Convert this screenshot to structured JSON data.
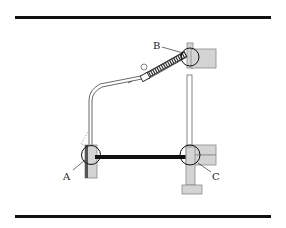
{
  "diagram": {
    "labels": {
      "a": "A",
      "b": "B",
      "c": "C"
    },
    "colors": {
      "line": "#111111",
      "block_fill": "#d4d4d4",
      "block_stroke": "#8a8a8a",
      "rule": "#111111",
      "background": "#ffffff"
    },
    "joints": [
      {
        "id": "A",
        "description": "lower-left pivot"
      },
      {
        "id": "B",
        "description": "upper spring anchor"
      },
      {
        "id": "C",
        "description": "lower-right pivot"
      }
    ]
  }
}
